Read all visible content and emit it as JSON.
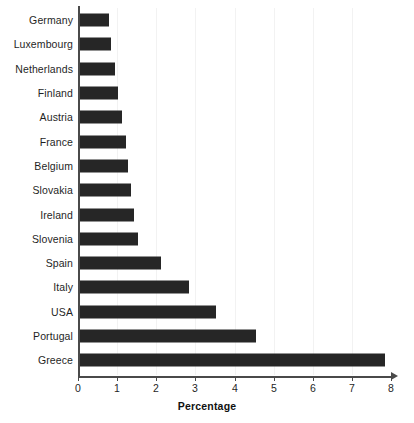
{
  "chart_data": {
    "type": "bar",
    "orientation": "horizontal",
    "title": "",
    "xlabel": "Percentage",
    "ylabel": "",
    "xlim": [
      0,
      8
    ],
    "ylim": null,
    "grid": false,
    "legend": null,
    "xticks": [
      "0",
      "1",
      "2",
      "3",
      "4",
      "5",
      "6",
      "7",
      "8"
    ],
    "categories": [
      "Germany",
      "Luxembourg",
      "Netherlands",
      "Finland",
      "Austria",
      "France",
      "Belgium",
      "Slovakia",
      "Ireland",
      "Slovenia",
      "Spain",
      "Italy",
      "USA",
      "Portugal",
      "Greece"
    ],
    "values": [
      0.77,
      0.82,
      0.92,
      1.0,
      1.1,
      1.2,
      1.25,
      1.33,
      1.4,
      1.5,
      2.1,
      2.8,
      3.5,
      4.5,
      7.8
    ],
    "bar_color": "#262626",
    "axis_color": "#4a4a4a"
  }
}
